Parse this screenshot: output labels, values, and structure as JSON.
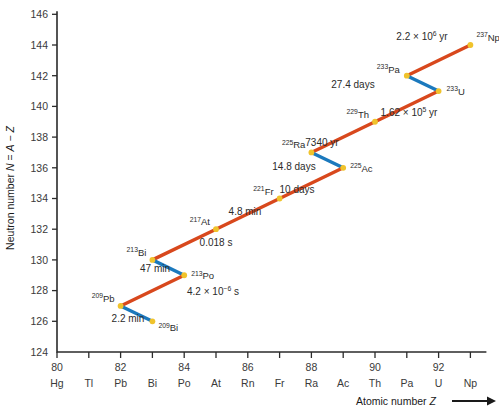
{
  "chart_data": {
    "type": "line",
    "title": "",
    "xlabel": "Atomic number Z",
    "ylabel": "Neutron number N = A − Z",
    "xlim": [
      79.5,
      93.8
    ],
    "ylim": [
      124,
      146.6
    ],
    "grid": false,
    "legend": null,
    "x_ticks": [
      80,
      82,
      84,
      86,
      88,
      90,
      92
    ],
    "x_tick_labels": [
      "80",
      "82",
      "84",
      "86",
      "88",
      "90",
      "92"
    ],
    "x_minor_ticks": [
      81,
      83,
      85,
      87,
      89,
      91,
      93
    ],
    "y_ticks": [
      124,
      126,
      128,
      130,
      132,
      134,
      136,
      138,
      140,
      142,
      144,
      146
    ],
    "y_tick_labels": [
      "124",
      "126",
      "128",
      "130",
      "132",
      "134",
      "136",
      "138",
      "140",
      "142",
      "144",
      "146"
    ],
    "element_symbols": [
      {
        "z": 80,
        "symbol": "Hg"
      },
      {
        "z": 81,
        "symbol": "Tl"
      },
      {
        "z": 82,
        "symbol": "Pb"
      },
      {
        "z": 83,
        "symbol": "Bi"
      },
      {
        "z": 84,
        "symbol": "Po"
      },
      {
        "z": 85,
        "symbol": "At"
      },
      {
        "z": 86,
        "symbol": "Rn"
      },
      {
        "z": 87,
        "symbol": "Fr"
      },
      {
        "z": 88,
        "symbol": "Ra"
      },
      {
        "z": 89,
        "symbol": "Ac"
      },
      {
        "z": 90,
        "symbol": "Th"
      },
      {
        "z": 91,
        "symbol": "Pa"
      },
      {
        "z": 92,
        "symbol": "U"
      },
      {
        "z": 93,
        "symbol": "Np"
      }
    ],
    "nuclides": [
      {
        "id": "bi209",
        "mass": "209",
        "element": "Bi",
        "z": 83,
        "n": 126,
        "label_dx": 6,
        "label_dy": 10,
        "anchor": "start"
      },
      {
        "id": "pb209",
        "mass": "209",
        "element": "Pb",
        "z": 82,
        "n": 127,
        "label_dx": -6,
        "label_dy": -4,
        "anchor": "end"
      },
      {
        "id": "po213",
        "mass": "213",
        "element": "Po",
        "z": 84,
        "n": 129,
        "label_dx": 7,
        "label_dy": 4,
        "anchor": "start"
      },
      {
        "id": "bi213",
        "mass": "213",
        "element": "Bi",
        "z": 83,
        "n": 130,
        "label_dx": -6,
        "label_dy": -4,
        "anchor": "end"
      },
      {
        "id": "at217",
        "mass": "217",
        "element": "At",
        "z": 85,
        "n": 132,
        "label_dx": -6,
        "label_dy": -4,
        "anchor": "end"
      },
      {
        "id": "fr221",
        "mass": "221",
        "element": "Fr",
        "z": 87,
        "n": 134,
        "label_dx": -6,
        "label_dy": -4,
        "anchor": "end"
      },
      {
        "id": "ac225",
        "mass": "225",
        "element": "Ac",
        "z": 89,
        "n": 136,
        "label_dx": 7,
        "label_dy": 4,
        "anchor": "start"
      },
      {
        "id": "ra225",
        "mass": "225",
        "element": "Ra",
        "z": 88,
        "n": 137,
        "label_dx": -6,
        "label_dy": -4,
        "anchor": "end"
      },
      {
        "id": "th229",
        "mass": "229",
        "element": "Th",
        "z": 90,
        "n": 139,
        "label_dx": -6,
        "label_dy": -4,
        "anchor": "end"
      },
      {
        "id": "u233",
        "mass": "233",
        "element": "U",
        "z": 92,
        "n": 141,
        "label_dx": 8,
        "label_dy": 4,
        "anchor": "start"
      },
      {
        "id": "pa233",
        "mass": "233",
        "element": "Pa",
        "z": 91,
        "n": 142,
        "label_dx": -7,
        "label_dy": -3,
        "anchor": "end"
      },
      {
        "id": "np237",
        "mass": "237",
        "element": "Np",
        "z": 93,
        "n": 144,
        "label_dx": 6,
        "label_dy": -4,
        "anchor": "start"
      }
    ],
    "decays": [
      {
        "id": "np237-pa233",
        "from": "np237",
        "to": "pa233",
        "mode": "alpha",
        "color": "#d8481d",
        "half_life": "2.2 × 10⁶ yr",
        "hl_mantissa": "2.2 × 10",
        "hl_exp": "6",
        "hl_suffix": " yr",
        "hl_x": 422,
        "hl_y": 40,
        "hl_anchor": "middle"
      },
      {
        "id": "pa233-u233",
        "from": "pa233",
        "to": "u233",
        "mode": "beta",
        "color": "#1b79bd",
        "half_life": "27.4 days",
        "hl_mantissa": "27.4 days",
        "hl_exp": "",
        "hl_suffix": "",
        "hl_x": 353,
        "hl_y": 88,
        "hl_anchor": "middle"
      },
      {
        "id": "u233-th229",
        "from": "u233",
        "to": "th229",
        "mode": "alpha",
        "color": "#d8481d",
        "half_life": "1.62 × 10⁵ yr",
        "hl_mantissa": "1.62 × 10",
        "hl_exp": "5",
        "hl_suffix": " yr",
        "hl_x": 409,
        "hl_y": 116,
        "hl_anchor": "middle"
      },
      {
        "id": "th229-ra225",
        "from": "th229",
        "to": "ra225",
        "mode": "alpha",
        "color": "#d8481d",
        "half_life": "7340 yr",
        "hl_mantissa": "7340 yr",
        "hl_exp": "",
        "hl_suffix": "",
        "hl_x": 322,
        "hl_y": 146,
        "hl_anchor": "middle"
      },
      {
        "id": "ra225-ac225",
        "from": "ra225",
        "to": "ac225",
        "mode": "beta",
        "color": "#1b79bd",
        "half_life": "14.8 days",
        "hl_mantissa": "14.8 days",
        "hl_exp": "",
        "hl_suffix": "",
        "hl_x": 294,
        "hl_y": 170,
        "hl_anchor": "middle"
      },
      {
        "id": "ac225-fr221",
        "from": "ac225",
        "to": "fr221",
        "mode": "alpha",
        "color": "#d8481d",
        "half_life": "10 days",
        "hl_mantissa": "10 days",
        "hl_exp": "",
        "hl_suffix": "",
        "hl_x": 297,
        "hl_y": 193,
        "hl_anchor": "middle"
      },
      {
        "id": "fr221-at217",
        "from": "fr221",
        "to": "at217",
        "mode": "alpha",
        "color": "#d8481d",
        "half_life": "4.8 min",
        "hl_mantissa": "4.8 min",
        "hl_exp": "",
        "hl_suffix": "",
        "hl_x": 245,
        "hl_y": 215,
        "hl_anchor": "middle"
      },
      {
        "id": "at217-bi213",
        "from": "at217",
        "to": "bi213",
        "mode": "alpha",
        "color": "#d8481d",
        "half_life": "0.018 s",
        "hl_mantissa": "0.018 s",
        "hl_exp": "",
        "hl_suffix": "",
        "hl_x": 216,
        "hl_y": 246,
        "hl_anchor": "middle"
      },
      {
        "id": "bi213-po213",
        "from": "bi213",
        "to": "po213",
        "mode": "beta",
        "color": "#1b79bd",
        "half_life": "47 min",
        "hl_mantissa": "47 min",
        "hl_exp": "",
        "hl_suffix": "",
        "hl_x": 155,
        "hl_y": 272,
        "hl_anchor": "middle"
      },
      {
        "id": "po213-pb209",
        "from": "po213",
        "to": "pb209",
        "mode": "alpha",
        "color": "#d8481d",
        "half_life": "4.2 × 10⁻⁶ s",
        "hl_mantissa": "4.2 × 10",
        "hl_exp": "−6",
        "hl_suffix": " s",
        "hl_x": 213,
        "hl_y": 295,
        "hl_anchor": "middle"
      },
      {
        "id": "pb209-bi209",
        "from": "pb209",
        "to": "bi209",
        "mode": "beta",
        "color": "#1b79bd",
        "half_life": "2.2 min",
        "hl_mantissa": "2.2 min",
        "hl_exp": "",
        "hl_suffix": "",
        "hl_x": 128,
        "hl_y": 322,
        "hl_anchor": "middle"
      }
    ],
    "colors": {
      "alpha": "#d8481d",
      "beta": "#1b79bd",
      "node": "#f0c32c",
      "axis": "#2b2b2b",
      "background": "#ffffff"
    }
  },
  "axis_titles": {
    "x_prefix": "Atomic number ",
    "x_italic": "Z",
    "y_prefix": "Neutron number ",
    "y_italic_n": "N",
    "y_eq": " = ",
    "y_italic_a": "A",
    "y_minus": " − ",
    "y_italic_z": "Z"
  }
}
